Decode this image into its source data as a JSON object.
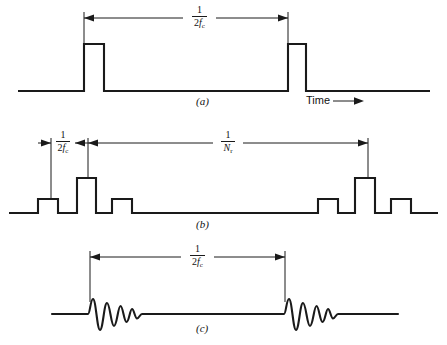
{
  "figure": {
    "background_color": "#ffffff",
    "line_color": "#1a1a1a",
    "time_axis_label": "Time",
    "time_arrow_icon": "right-arrow-icon"
  },
  "panels": [
    {
      "id": "a",
      "label": "(a)",
      "description": "Rectangular pulse train, two pulses",
      "dimension": {
        "numerator": "1",
        "denominator_prefix": "2",
        "denominator_symbol": "f",
        "denominator_subscript": "c",
        "text": "1/2f_c"
      }
    },
    {
      "id": "b",
      "label": "(b)",
      "description": "Grouped rectangular pulses, three per group with taller centre pulse",
      "dimension_short": {
        "numerator": "1",
        "denominator_prefix": "2",
        "denominator_symbol": "f",
        "denominator_subscript": "c",
        "text": "1/2f_c"
      },
      "dimension_long": {
        "numerator": "1",
        "denominator_prefix": "",
        "denominator_symbol": "N",
        "denominator_subscript": "r",
        "text": "1/N_r"
      }
    },
    {
      "id": "c",
      "label": "(c)",
      "description": "Damped oscillatory bursts, two bursts",
      "dimension": {
        "numerator": "1",
        "denominator_prefix": "2",
        "denominator_symbol": "f",
        "denominator_subscript": "c",
        "text": "1/2f_c"
      }
    }
  ]
}
